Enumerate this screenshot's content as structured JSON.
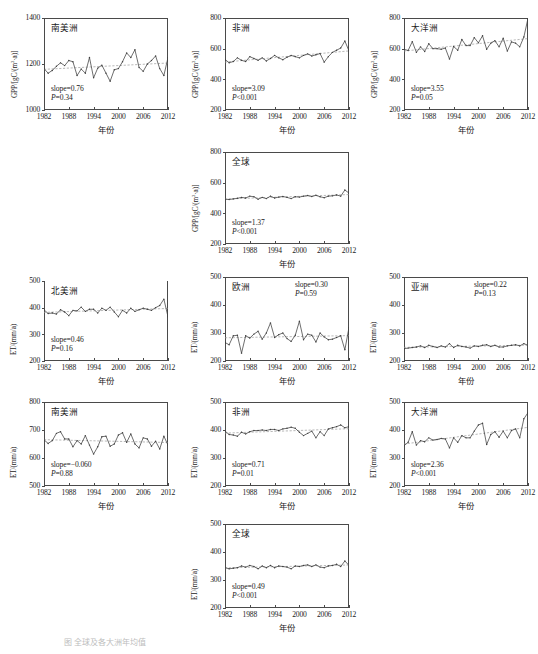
{
  "figure": {
    "xlabel": "年份",
    "xticks": [
      1982,
      1988,
      1994,
      2000,
      2006,
      2012
    ],
    "caption": "图        全球及各大洲年均值"
  },
  "axis_labels": {
    "gpp": "GPP/[gC/(m2·a)]",
    "et": "ET/(mm/a)"
  },
  "chart_data": [
    {
      "id": "gpp-south-america",
      "type": "line",
      "title": "南美洲",
      "variable": "GPP",
      "ylabel": "GPP/[gC/(m2·a)]",
      "xlabel": "年份",
      "ylim": [
        1000,
        1400
      ],
      "yticks": [
        1000,
        1200,
        1400
      ],
      "xlim": [
        1982,
        2012
      ],
      "slope_label": "slope=0.76",
      "p_label": "P=0.34",
      "slope": 0.76,
      "p": 0.34,
      "x": [
        1982,
        1983,
        1984,
        1985,
        1986,
        1987,
        1988,
        1989,
        1990,
        1991,
        1992,
        1993,
        1994,
        1995,
        1996,
        1997,
        1998,
        1999,
        2000,
        2001,
        2002,
        2003,
        2004,
        2005,
        2006,
        2007,
        2008,
        2009,
        2010,
        2011,
        2012
      ],
      "values": [
        1180,
        1160,
        1172,
        1190,
        1205,
        1193,
        1215,
        1210,
        1150,
        1178,
        1160,
        1228,
        1140,
        1182,
        1195,
        1160,
        1125,
        1175,
        1180,
        1210,
        1248,
        1228,
        1262,
        1185,
        1168,
        1200,
        1215,
        1235,
        1180,
        1150,
        1228
      ]
    },
    {
      "id": "gpp-africa",
      "type": "line",
      "title": "非洲",
      "variable": "GPP",
      "ylabel": "GPP/[gC/(m2·a)]",
      "xlabel": "年份",
      "ylim": [
        200,
        800
      ],
      "yticks": [
        200,
        400,
        600,
        800
      ],
      "xlim": [
        1982,
        2012
      ],
      "slope_label": "slope=3.09",
      "p_label": "P<0.001",
      "slope": 3.09,
      "p": 0.0005,
      "x": [
        1982,
        1983,
        1984,
        1985,
        1986,
        1987,
        1988,
        1989,
        1990,
        1991,
        1992,
        1993,
        1994,
        1995,
        1996,
        1997,
        1998,
        1999,
        2000,
        2001,
        2002,
        2003,
        2004,
        2005,
        2006,
        2007,
        2008,
        2009,
        2010,
        2011,
        2012
      ],
      "values": [
        530,
        508,
        516,
        540,
        524,
        516,
        548,
        536,
        524,
        540,
        520,
        536,
        556,
        540,
        528,
        544,
        556,
        548,
        540,
        556,
        566,
        552,
        560,
        568,
        512,
        548,
        576,
        590,
        604,
        650,
        585
      ]
    },
    {
      "id": "gpp-oceania",
      "type": "line",
      "title": "大洋洲",
      "variable": "GPP",
      "ylabel": "GPP/[gC/(m2·a)]",
      "xlabel": "年份",
      "ylim": [
        200,
        800
      ],
      "yticks": [
        200,
        400,
        600,
        800
      ],
      "xlim": [
        1982,
        2012
      ],
      "slope_label": "slope=3.55",
      "p_label": "P=0.05",
      "slope": 3.55,
      "p": 0.05,
      "x": [
        1982,
        1983,
        1984,
        1985,
        1986,
        1987,
        1988,
        1989,
        1990,
        1991,
        1992,
        1993,
        1994,
        1995,
        1996,
        1997,
        1998,
        1999,
        2000,
        2001,
        2002,
        2003,
        2004,
        2005,
        2006,
        2007,
        2008,
        2009,
        2010,
        2011,
        2012
      ],
      "values": [
        596,
        588,
        646,
        576,
        612,
        582,
        632,
        600,
        600,
        596,
        604,
        532,
        614,
        590,
        660,
        620,
        620,
        672,
        638,
        684,
        596,
        636,
        652,
        612,
        668,
        584,
        644,
        636,
        612,
        676,
        798
      ]
    },
    {
      "id": "gpp-global",
      "type": "line",
      "title": "全球",
      "variable": "GPP",
      "ylabel": "GPP/[gC/(m2·a)]",
      "xlabel": "年份",
      "ylim": [
        200,
        800
      ],
      "yticks": [
        200,
        400,
        600,
        800
      ],
      "xlim": [
        1982,
        2012
      ],
      "slope_label": "slope=1.37",
      "p_label": "P<0.001",
      "slope": 1.37,
      "p": 0.0005,
      "x": [
        1982,
        1983,
        1984,
        1985,
        1986,
        1987,
        1988,
        1989,
        1990,
        1991,
        1992,
        1993,
        1994,
        1995,
        1996,
        1997,
        1998,
        1999,
        2000,
        2001,
        2002,
        2003,
        2004,
        2005,
        2006,
        2007,
        2008,
        2009,
        2010,
        2011,
        2012
      ],
      "values": [
        492,
        490,
        494,
        498,
        504,
        500,
        512,
        508,
        492,
        504,
        496,
        512,
        500,
        506,
        510,
        504,
        496,
        508,
        506,
        512,
        516,
        510,
        518,
        508,
        502,
        512,
        514,
        520,
        512,
        552,
        532
      ]
    },
    {
      "id": "et-north-america",
      "type": "line",
      "title": "北美洲",
      "variable": "ET",
      "ylabel": "ET/(mm/a)",
      "xlabel": "年份",
      "ylim": [
        200,
        500
      ],
      "yticks": [
        200,
        300,
        400,
        500
      ],
      "xlim": [
        1982,
        2012
      ],
      "slope_label": "slope=0.46",
      "p_label": "P=0.16",
      "slope": 0.46,
      "p": 0.16,
      "x": [
        1982,
        1983,
        1984,
        1985,
        1986,
        1987,
        1988,
        1989,
        1990,
        1991,
        1992,
        1993,
        1994,
        1995,
        1996,
        1997,
        1998,
        1999,
        2000,
        2001,
        2002,
        2003,
        2004,
        2005,
        2006,
        2007,
        2008,
        2009,
        2010,
        2011,
        2012
      ],
      "values": [
        392,
        378,
        380,
        376,
        392,
        384,
        370,
        390,
        388,
        402,
        386,
        394,
        394,
        380,
        398,
        390,
        402,
        384,
        366,
        390,
        380,
        398,
        386,
        392,
        398,
        394,
        390,
        400,
        408,
        432,
        366
      ]
    },
    {
      "id": "et-europe",
      "type": "line",
      "title": "欧洲",
      "variable": "ET",
      "ylabel": "ET/(mm/a)",
      "xlabel": "年份",
      "ylim": [
        200,
        500
      ],
      "yticks": [
        200,
        300,
        400,
        500
      ],
      "xlim": [
        1982,
        2012
      ],
      "slope_label": "slope=0.30",
      "p_label": "P=0.59",
      "slope": 0.3,
      "p": 0.59,
      "x": [
        1982,
        1983,
        1984,
        1985,
        1986,
        1987,
        1988,
        1989,
        1990,
        1991,
        1992,
        1993,
        1994,
        1995,
        1996,
        1997,
        1998,
        1999,
        2000,
        2001,
        2002,
        2003,
        2004,
        2005,
        2006,
        2007,
        2008,
        2009,
        2010,
        2011,
        2012
      ],
      "values": [
        266,
        258,
        290,
        292,
        228,
        290,
        282,
        296,
        306,
        278,
        300,
        336,
        284,
        294,
        300,
        280,
        270,
        292,
        342,
        276,
        296,
        292,
        268,
        300,
        286,
        276,
        278,
        284,
        290,
        240,
        320
      ]
    },
    {
      "id": "et-asia",
      "type": "line",
      "title": "亚洲",
      "variable": "ET",
      "ylabel": "ET/(mm/a)",
      "xlabel": "年份",
      "ylim": [
        200,
        500
      ],
      "yticks": [
        200,
        300,
        400,
        500
      ],
      "xlim": [
        1982,
        2012
      ],
      "slope_label": "slope=0.22",
      "p_label": "P=0.13",
      "slope": 0.22,
      "p": 0.13,
      "x": [
        1982,
        1983,
        1984,
        1985,
        1986,
        1987,
        1988,
        1989,
        1990,
        1991,
        1992,
        1993,
        1994,
        1995,
        1996,
        1997,
        1998,
        1999,
        2000,
        2001,
        2002,
        2003,
        2004,
        2005,
        2006,
        2007,
        2008,
        2009,
        2010,
        2011,
        2012
      ],
      "values": [
        244,
        246,
        248,
        250,
        254,
        248,
        256,
        252,
        248,
        254,
        250,
        262,
        248,
        256,
        252,
        250,
        246,
        254,
        252,
        256,
        258,
        252,
        256,
        250,
        250,
        254,
        256,
        258,
        254,
        262,
        256
      ]
    },
    {
      "id": "et-south-america",
      "type": "line",
      "title": "南美洲",
      "variable": "ET",
      "ylabel": "ET/(mm/a)",
      "xlabel": "年份",
      "ylim": [
        500,
        800
      ],
      "yticks": [
        500,
        600,
        700,
        800
      ],
      "xlim": [
        1982,
        2012
      ],
      "slope_label": "slope=−0.060",
      "p_label": "P=0.88",
      "slope": -0.06,
      "p": 0.88,
      "x": [
        1982,
        1983,
        1984,
        1985,
        1986,
        1987,
        1988,
        1989,
        1990,
        1991,
        1992,
        1993,
        1994,
        1995,
        1996,
        1997,
        1998,
        1999,
        2000,
        2001,
        2002,
        2003,
        2004,
        2005,
        2006,
        2007,
        2008,
        2009,
        2010,
        2011,
        2012
      ],
      "values": [
        665,
        652,
        662,
        688,
        694,
        668,
        668,
        640,
        662,
        650,
        680,
        646,
        614,
        640,
        676,
        678,
        642,
        650,
        682,
        690,
        656,
        686,
        650,
        636,
        672,
        668,
        642,
        660,
        632,
        678,
        646
      ]
    },
    {
      "id": "et-africa",
      "type": "line",
      "title": "非洲",
      "variable": "ET",
      "ylabel": "ET/(mm/a)",
      "xlabel": "年份",
      "ylim": [
        200,
        500
      ],
      "yticks": [
        200,
        300,
        400,
        500
      ],
      "xlim": [
        1982,
        2012
      ],
      "slope_label": "slope=0.71",
      "p_label": "P=0.01",
      "slope": 0.71,
      "p": 0.01,
      "x": [
        1982,
        1983,
        1984,
        1985,
        1986,
        1987,
        1988,
        1989,
        1990,
        1991,
        1992,
        1993,
        1994,
        1995,
        1996,
        1997,
        1998,
        1999,
        2000,
        2001,
        2002,
        2003,
        2004,
        2005,
        2006,
        2007,
        2008,
        2009,
        2010,
        2011,
        2012
      ],
      "values": [
        396,
        384,
        382,
        378,
        392,
        386,
        394,
        398,
        398,
        400,
        398,
        402,
        402,
        398,
        404,
        406,
        410,
        406,
        392,
        380,
        388,
        396,
        372,
        394,
        380,
        404,
        408,
        412,
        418,
        408,
        412
      ]
    },
    {
      "id": "et-oceania",
      "type": "line",
      "title": "大洋洲",
      "variable": "ET",
      "ylabel": "ET/(mm/a)",
      "xlabel": "年份",
      "ylim": [
        200,
        500
      ],
      "yticks": [
        200,
        300,
        400,
        500
      ],
      "xlim": [
        1982,
        2012
      ],
      "slope_label": "slope=2.36",
      "p_label": "P<0.001",
      "slope": 2.36,
      "p": 0.0005,
      "x": [
        1982,
        1983,
        1984,
        1985,
        1986,
        1987,
        1988,
        1989,
        1990,
        1991,
        1992,
        1993,
        1994,
        1995,
        1996,
        1997,
        1998,
        1999,
        2000,
        2001,
        2002,
        2003,
        2004,
        2005,
        2006,
        2007,
        2008,
        2009,
        2010,
        2011,
        2012
      ],
      "values": [
        344,
        356,
        394,
        346,
        362,
        358,
        372,
        364,
        366,
        370,
        368,
        336,
        372,
        356,
        380,
        372,
        372,
        396,
        418,
        424,
        348,
        384,
        394,
        374,
        396,
        372,
        398,
        404,
        372,
        440,
        462
      ]
    },
    {
      "id": "et-global",
      "type": "line",
      "title": "全球",
      "variable": "ET",
      "ylabel": "ET/(mm/a)",
      "xlabel": "年份",
      "ylim": [
        200,
        500
      ],
      "yticks": [
        200,
        300,
        400,
        500
      ],
      "xlim": [
        1982,
        2012
      ],
      "slope_label": "slope=0.49",
      "p_label": "P<0.001",
      "slope": 0.49,
      "p": 0.0005,
      "x": [
        1982,
        1983,
        1984,
        1985,
        1986,
        1987,
        1988,
        1989,
        1990,
        1991,
        1992,
        1993,
        1994,
        1995,
        1996,
        1997,
        1998,
        1999,
        2000,
        2001,
        2002,
        2003,
        2004,
        2005,
        2006,
        2007,
        2008,
        2009,
        2010,
        2011,
        2012
      ],
      "values": [
        344,
        340,
        342,
        344,
        350,
        346,
        352,
        348,
        340,
        350,
        344,
        352,
        344,
        350,
        348,
        346,
        340,
        350,
        348,
        352,
        354,
        348,
        354,
        346,
        344,
        350,
        352,
        356,
        348,
        368,
        352
      ]
    }
  ]
}
